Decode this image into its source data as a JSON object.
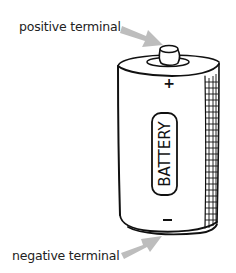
{
  "diagram": {
    "subject": "battery",
    "labels": {
      "positive": "positive terminal",
      "negative": "negative terminal",
      "battery_text": "BATTERY",
      "plus_sign": "+",
      "minus_sign": "−"
    },
    "colors": {
      "arrow": "#bdbdbd",
      "outline": "#111111",
      "text": "#222222",
      "background": "#ffffff"
    }
  }
}
